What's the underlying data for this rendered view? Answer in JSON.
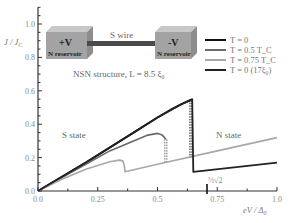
{
  "chart_data": {
    "type": "line",
    "title": "",
    "xlabel": "eV / Δ₀",
    "ylabel": "J / J_C",
    "xlim": [
      0,
      1.0
    ],
    "ylim": [
      0,
      1.1
    ],
    "x_ticks": [
      0.0,
      0.25,
      0.5,
      0.75,
      1.0
    ],
    "x_tick_labels": [
      "0.0",
      "0.25",
      "0.5",
      "0.75",
      "1.0"
    ],
    "y_ticks": [
      0.0,
      0.2,
      0.4,
      0.6,
      0.8,
      1.0
    ],
    "y_tick_labels": [
      "0.0",
      "0.2",
      "0.4",
      "0.6",
      "0.8",
      "1.0"
    ],
    "grid": false,
    "legend_position": "top-right",
    "series": [
      {
        "name": "T = 0",
        "color": "#111111",
        "points": [
          [
            0,
            0
          ],
          [
            0.1,
            0.085
          ],
          [
            0.2,
            0.17
          ],
          [
            0.3,
            0.26
          ],
          [
            0.4,
            0.35
          ],
          [
            0.5,
            0.44
          ],
          [
            0.56,
            0.49
          ],
          [
            0.6,
            0.52
          ],
          [
            0.64,
            0.545
          ]
        ],
        "drop": {
          "x": 0.64,
          "to": 0.2,
          "dashed": true
        }
      },
      {
        "name": "T = 0.5 T_C",
        "color": "#6a6a6a",
        "points": [
          [
            0,
            0
          ],
          [
            0.1,
            0.08
          ],
          [
            0.2,
            0.16
          ],
          [
            0.3,
            0.24
          ],
          [
            0.4,
            0.3
          ],
          [
            0.46,
            0.335
          ],
          [
            0.5,
            0.345
          ],
          [
            0.52,
            0.335
          ],
          [
            0.535,
            0.31
          ]
        ],
        "drop": {
          "x": 0.535,
          "to": 0.165,
          "dashed": true
        }
      },
      {
        "name": "T = 0.75 T_C",
        "color": "#a8a8a8",
        "points": [
          [
            0,
            0
          ],
          [
            0.1,
            0.07
          ],
          [
            0.2,
            0.13
          ],
          [
            0.3,
            0.175
          ],
          [
            0.34,
            0.185
          ],
          [
            0.355,
            0.18
          ],
          [
            0.36,
            0.16
          ],
          [
            0.365,
            0.115
          ],
          [
            0.5,
            0.16
          ],
          [
            0.75,
            0.24
          ],
          [
            1.0,
            0.32
          ]
        ],
        "drop": null
      },
      {
        "name": "T = 0 (17ξ₀)",
        "color": "#222222",
        "points": [
          [
            0,
            0
          ],
          [
            0.1,
            0.085
          ],
          [
            0.2,
            0.17
          ],
          [
            0.3,
            0.26
          ],
          [
            0.4,
            0.35
          ],
          [
            0.5,
            0.44
          ],
          [
            0.6,
            0.52
          ],
          [
            0.645,
            0.55
          ],
          [
            0.65,
            0.115
          ],
          [
            1.0,
            0.17
          ]
        ],
        "drop": {
          "x": 0.65,
          "to": 0.115,
          "dashed": true
        }
      }
    ],
    "annotations": [
      {
        "text": "S state",
        "x": 0.17,
        "y": 0.33
      },
      {
        "text": "N state",
        "x": 0.83,
        "y": 0.35
      },
      {
        "text": "½√2",
        "x": 0.71,
        "y": 0.02
      }
    ]
  },
  "inset": {
    "left_box_title": "+V",
    "left_box_sub": "N reservoir",
    "right_box_title": "-V",
    "right_box_sub": "N reservoir",
    "wire_label": "S wire",
    "caption": "NSN structure, L = 8.5 ξ₀"
  },
  "labels": {
    "x_axis": "eV / Δ₀",
    "y_axis": "J / J_C",
    "s_state": "S state",
    "n_state": "N state",
    "special_tick": "½√2"
  }
}
